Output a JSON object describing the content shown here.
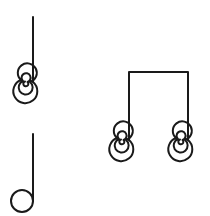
{
  "figure": {
    "stroke_color": "#1a1a1a",
    "background": "#ffffff",
    "glyphs": [
      {
        "id": "quarter-note-spiral",
        "notehead": "spiral",
        "stem": "up-right"
      },
      {
        "id": "half-note-open",
        "notehead": "open-circle",
        "stem": "up-right"
      },
      {
        "id": "beamed-eighth-pair-spiral",
        "notehead": "spiral",
        "stems": 2,
        "beam": "flat-top"
      }
    ]
  }
}
